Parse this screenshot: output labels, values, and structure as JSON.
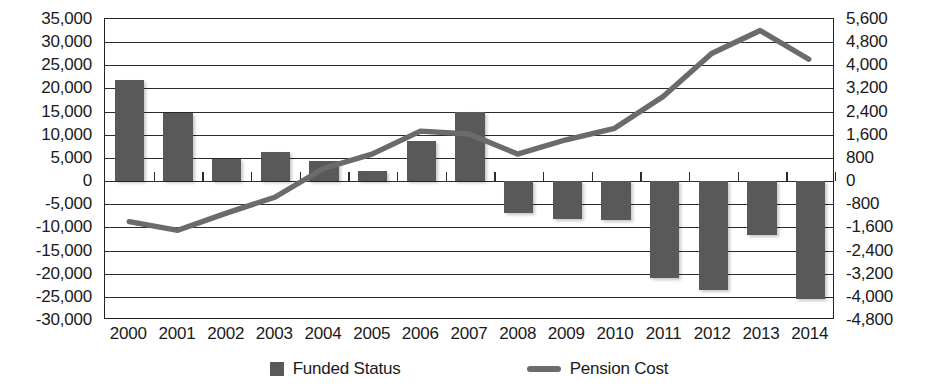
{
  "chart_data": {
    "type": "bar",
    "title": "",
    "subtitle": "",
    "xlabel": "",
    "ylabel": "",
    "grid": true,
    "legend_position": "bottom",
    "categories": [
      "2000",
      "2001",
      "2002",
      "2003",
      "2004",
      "2005",
      "2006",
      "2007",
      "2008",
      "2009",
      "2010",
      "2011",
      "2012",
      "2013",
      "2014"
    ],
    "series": [
      {
        "name": "Funded Status",
        "type": "bar",
        "axis": "left",
        "color": "#595959",
        "values": [
          21800,
          14800,
          4700,
          6200,
          4400,
          2200,
          8600,
          15000,
          -7000,
          -8100,
          -8400,
          -21000,
          -23500,
          -11700,
          -25500
        ]
      },
      {
        "name": "Pension Cost",
        "type": "line",
        "axis": "right",
        "color": "#6b6b6b",
        "values": [
          -1450,
          -1750,
          -1150,
          -600,
          400,
          900,
          1700,
          1600,
          900,
          1400,
          1800,
          2900,
          4400,
          5200,
          4200
        ]
      }
    ],
    "left_axis": {
      "min": -30000,
      "max": 35000,
      "step": 5000,
      "ticks": [
        "35,000",
        "30,000",
        "25,000",
        "20,000",
        "15,000",
        "10,000",
        "5,000",
        "0",
        "-5,000",
        "-10,000",
        "-15,000",
        "-20,000",
        "-25,000",
        "-30,000"
      ]
    },
    "right_axis": {
      "min": -4800,
      "max": 5600,
      "step": 800,
      "ticks": [
        "5,600",
        "4,800",
        "4,000",
        "3,200",
        "2,400",
        "1,600",
        "800",
        "0",
        "-800",
        "-1,600",
        "-2,400",
        "-3,200",
        "-4,000",
        "-4,800"
      ]
    }
  },
  "legend": {
    "items": [
      {
        "label": "Funded Status",
        "marker": "square-swatch-icon"
      },
      {
        "label": "Pension Cost",
        "marker": "line-swatch-icon"
      }
    ]
  }
}
